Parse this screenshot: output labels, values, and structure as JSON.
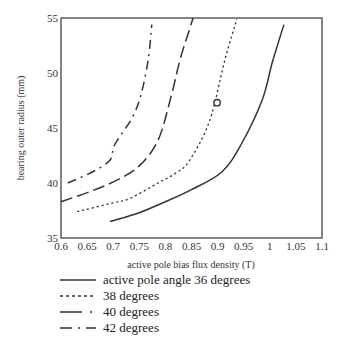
{
  "chart_data": {
    "type": "line",
    "title": "",
    "xlabel": "active pole bias flux density (T)",
    "ylabel": "bearing outer radius (mm)",
    "xlim": [
      0.6,
      1.1
    ],
    "ylim": [
      35,
      55
    ],
    "xticks": [
      "0.6",
      "0.65",
      "0.7",
      "0.75",
      "0.8",
      "0.85",
      "0.9",
      "0.95",
      "1",
      "1.05",
      "1.1"
    ],
    "yticks": [
      "35",
      "40",
      "45",
      "50",
      "55"
    ],
    "grid": false,
    "legend_position": "below",
    "series": [
      {
        "name": "active pole angle 36 degrees",
        "style": "solid",
        "x": [
          0.694,
          0.75,
          0.8,
          0.85,
          0.908,
          0.945,
          0.985,
          1.005,
          1.027
        ],
        "y": [
          36.5,
          37.3,
          38.3,
          39.4,
          41.0,
          43.5,
          47.5,
          51.0,
          54.4
        ]
      },
      {
        "name": "38 degrees",
        "style": "dotted",
        "x": [
          0.631,
          0.7,
          0.732,
          0.786,
          0.82,
          0.847,
          0.885,
          0.914,
          0.937
        ],
        "y": [
          37.4,
          38.2,
          38.6,
          40.0,
          40.9,
          42.1,
          45.7,
          51.2,
          54.9
        ]
      },
      {
        "name": "40 degrees",
        "style": "dashed",
        "x": [
          0.6,
          0.66,
          0.709,
          0.751,
          0.786,
          0.81,
          0.828,
          0.845,
          0.853
        ],
        "y": [
          38.3,
          39.3,
          40.3,
          41.6,
          43.9,
          47.7,
          51.2,
          53.8,
          55.0
        ]
      },
      {
        "name": "42 degrees",
        "style": "dash-dot",
        "x": [
          0.613,
          0.66,
          0.694,
          0.703,
          0.736,
          0.753,
          0.767,
          0.774
        ],
        "y": [
          40.0,
          41.0,
          42.1,
          43.5,
          45.9,
          48.0,
          51.2,
          54.4
        ]
      }
    ],
    "markers": [
      {
        "shape": "open-circle",
        "x": 0.899,
        "y": 47.3,
        "series": "38 degrees"
      }
    ]
  },
  "legend": {
    "items": [
      {
        "label": "active pole angle 36 degrees",
        "style": "solid"
      },
      {
        "label": "38 degrees",
        "style": "dotted"
      },
      {
        "label": "40 degrees",
        "style": "dashed"
      },
      {
        "label": "42 degrees",
        "style": "dash-dot"
      }
    ]
  },
  "colors": {
    "line": "#333333",
    "axis": "#444444",
    "background": "#ffffff"
  }
}
